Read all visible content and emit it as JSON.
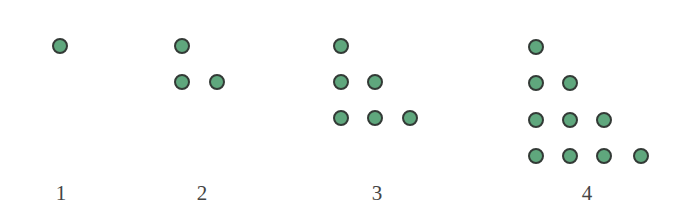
{
  "figure": {
    "dot_fill_color": "#5fa77d",
    "dot_stroke_color": "#333a36",
    "label_color": "#444444",
    "groups": [
      {
        "label": "1",
        "label_pos": [
          61,
          183
        ],
        "dots": [
          [
            60,
            46
          ]
        ]
      },
      {
        "label": "2",
        "label_pos": [
          202,
          183
        ],
        "dots": [
          [
            182,
            46
          ],
          [
            182,
            82
          ],
          [
            217,
            82
          ]
        ]
      },
      {
        "label": "3",
        "label_pos": [
          377,
          183
        ],
        "dots": [
          [
            341,
            46
          ],
          [
            341,
            82
          ],
          [
            375,
            82
          ],
          [
            341,
            118
          ],
          [
            375,
            118
          ],
          [
            410,
            118
          ]
        ]
      },
      {
        "label": "4",
        "label_pos": [
          587,
          183
        ],
        "dots": [
          [
            536,
            47
          ],
          [
            536,
            83
          ],
          [
            570,
            83
          ],
          [
            536,
            120
          ],
          [
            570,
            120
          ],
          [
            604,
            120
          ],
          [
            536,
            156
          ],
          [
            570,
            156
          ],
          [
            604,
            156
          ],
          [
            641,
            156
          ]
        ]
      }
    ]
  }
}
